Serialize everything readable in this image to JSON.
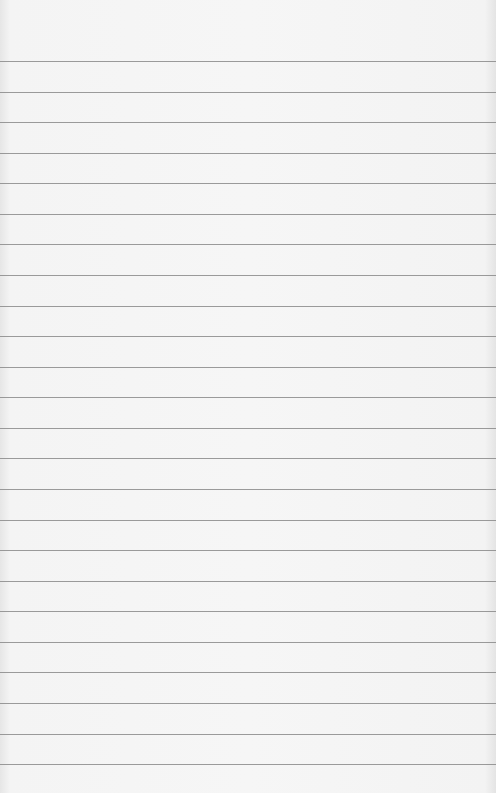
{
  "paper": {
    "type": "lined-paper",
    "background_color": "#f5f5f5",
    "line_color": "#8a8a8a",
    "first_line_y": 61,
    "line_spacing": 30.57,
    "line_count": 24
  }
}
